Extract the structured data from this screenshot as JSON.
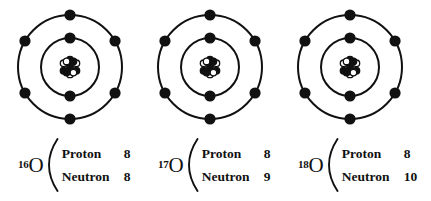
{
  "figure": {
    "background_color": "#ffffff",
    "ink_color": "#111111"
  },
  "atom_model": {
    "shells": [
      {
        "name": "inner-shell",
        "electron_count": 2,
        "radius": 29,
        "electron_angles_deg": [
          270,
          90
        ]
      },
      {
        "name": "outer-shell",
        "electron_count": 6,
        "radius": 52,
        "electron_angles_deg": [
          270,
          330,
          30,
          90,
          150,
          210
        ]
      }
    ],
    "electron_radius": 5.6,
    "ring_stroke": 2,
    "nucleus": {
      "name": "nucleus-cluster",
      "particle_radius": 3.3,
      "filled_color": "#111111",
      "hollow_color": "#ffffff",
      "particles": [
        {
          "dx": 0,
          "dy": -7.4,
          "fill": "filled"
        },
        {
          "dx": 6.4,
          "dy": -3.7,
          "fill": "hollow"
        },
        {
          "dx": 6.4,
          "dy": 3.7,
          "fill": "filled"
        },
        {
          "dx": 0,
          "dy": 7.4,
          "fill": "hollow"
        },
        {
          "dx": -6.4,
          "dy": 3.7,
          "fill": "filled"
        },
        {
          "dx": -6.4,
          "dy": -3.7,
          "fill": "hollow"
        },
        {
          "dx": 0,
          "dy": 0,
          "fill": "filled"
        },
        {
          "dx": -3.4,
          "dy": -5.6,
          "fill": "hollow"
        },
        {
          "dx": 3.4,
          "dy": -5.6,
          "fill": "filled"
        },
        {
          "dx": 3.4,
          "dy": 5.6,
          "fill": "hollow"
        },
        {
          "dx": -3.4,
          "dy": 5.6,
          "fill": "filled"
        }
      ]
    }
  },
  "isotopes": [
    {
      "id": "oxygen-16",
      "mass_number": "16",
      "element_symbol": "O",
      "rows": [
        {
          "label": "Proton",
          "count": "8"
        },
        {
          "label": "Neutron",
          "count": "8"
        }
      ]
    },
    {
      "id": "oxygen-17",
      "mass_number": "17",
      "element_symbol": "O",
      "rows": [
        {
          "label": "Proton",
          "count": "8"
        },
        {
          "label": "Neutron",
          "count": "9"
        }
      ]
    },
    {
      "id": "oxygen-18",
      "mass_number": "18",
      "element_symbol": "O",
      "rows": [
        {
          "label": "Proton",
          "count": "8"
        },
        {
          "label": "Neutron",
          "count": "10"
        }
      ]
    }
  ]
}
